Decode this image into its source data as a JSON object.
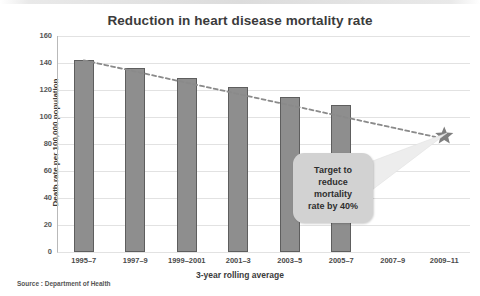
{
  "chart_data": {
    "type": "bar",
    "title": "Reduction in heart disease mortality rate",
    "xlabel": "3-year rolling average",
    "ylabel": "Death rate per 100,000 population",
    "categories": [
      "1995–7",
      "1997–9",
      "1999–2001",
      "2001–3",
      "2003–5",
      "2005–7",
      "2007–9",
      "2009–11"
    ],
    "values": [
      142,
      136,
      129,
      122.5,
      115,
      109,
      null,
      null
    ],
    "ylim": [
      0,
      160
    ],
    "ytick_labels": [
      "0",
      "20",
      "40",
      "60",
      "80",
      "100",
      "120",
      "140",
      "160"
    ],
    "ytick_values": [
      0,
      20,
      40,
      60,
      80,
      100,
      120,
      140,
      160
    ],
    "grid": true,
    "legend": "none",
    "bar_color": "#8e8e8e",
    "bar_border_color": "#5e5e5e",
    "series": [
      {
        "name": "Death rate",
        "type": "bar",
        "values": [
          142,
          136,
          129,
          122.5,
          115,
          109,
          null,
          null
        ]
      },
      {
        "name": "Target trend",
        "type": "line",
        "style": "dashed",
        "color": "#8a8a8a",
        "points": [
          {
            "x": "1995–7",
            "y": 142
          },
          {
            "x": "2009–11",
            "y": 86
          }
        ]
      }
    ],
    "markers": [
      {
        "name": "target-star",
        "shape": "star",
        "x": "2009–11",
        "y": 86,
        "color": "#7f7f7f"
      }
    ],
    "annotations": [
      {
        "name": "target-callout",
        "text": "Target to reduce mortality rate by 40%",
        "points_to": "target-star"
      }
    ],
    "source": "Source : Department of Health"
  },
  "callout": {
    "line1": "Target to",
    "line2": "reduce",
    "line3": "mortality",
    "line4": "rate by 40%"
  }
}
